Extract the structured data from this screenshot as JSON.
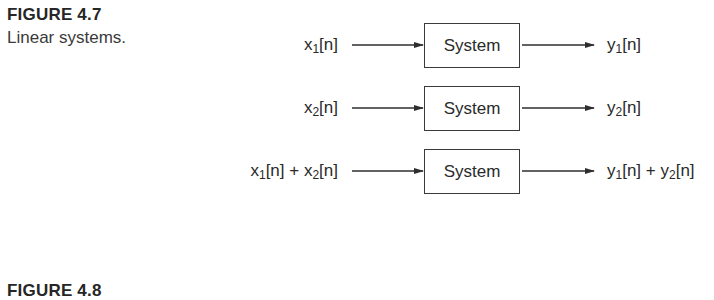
{
  "figure_4_7": {
    "title": "FIGURE 4.7",
    "caption": "Linear systems.",
    "rows": [
      {
        "input": [
          {
            "t": "x"
          },
          {
            "sub": "1"
          },
          {
            "t": "[n]"
          }
        ],
        "block": "System",
        "output": [
          {
            "t": "y"
          },
          {
            "sub": "1"
          },
          {
            "t": "[n]"
          }
        ]
      },
      {
        "input": [
          {
            "t": "x"
          },
          {
            "sub": "2"
          },
          {
            "t": "[n]"
          }
        ],
        "block": "System",
        "output": [
          {
            "t": "y"
          },
          {
            "sub": "2"
          },
          {
            "t": "[n]"
          }
        ]
      },
      {
        "input": [
          {
            "t": "x"
          },
          {
            "sub": "1"
          },
          {
            "t": "[n] + x"
          },
          {
            "sub": "2"
          },
          {
            "t": "[n]"
          }
        ],
        "block": "System",
        "output": [
          {
            "t": "y"
          },
          {
            "sub": "1"
          },
          {
            "t": "[n] + y"
          },
          {
            "sub": "2"
          },
          {
            "t": "[n]"
          }
        ]
      }
    ]
  },
  "figure_4_8": {
    "title": "FIGURE 4.8"
  },
  "colors": {
    "line": "#2e2e2e",
    "text": "#2a2a2a"
  }
}
